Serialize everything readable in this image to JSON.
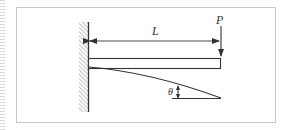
{
  "diagram": {
    "type": "cantilever-beam",
    "labels": {
      "length": "L",
      "load": "P",
      "angle": "θ"
    },
    "colors": {
      "stroke": "#333333",
      "hatch": "#8a8a8a",
      "frame": "#c9c9c9"
    }
  }
}
